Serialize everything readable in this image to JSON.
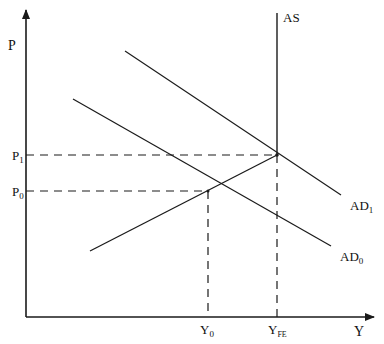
{
  "diagram": {
    "type": "AD-AS macroeconomic diagram",
    "axes": {
      "y_label": "P",
      "x_label": "Y"
    },
    "curves": {
      "as": {
        "label": "AS"
      },
      "ad1": {
        "label_main": "AD",
        "label_sub": "1"
      },
      "ad0": {
        "label_main": "AD",
        "label_sub": "0"
      }
    },
    "price_levels": {
      "p1": {
        "main": "P",
        "sub": "1"
      },
      "p0": {
        "main": "P",
        "sub": "0"
      }
    },
    "output_levels": {
      "y0": {
        "main": "Y",
        "sub": "0"
      },
      "yfe": {
        "main": "Y",
        "sub": "FE"
      }
    },
    "colors": {
      "line": "#1a1a1a",
      "background": "#ffffff"
    }
  }
}
